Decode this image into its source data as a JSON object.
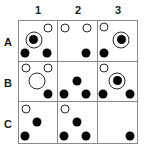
{
  "figure": {
    "colors": {
      "grid_line": "#8a8a8a",
      "token_fill": "#050505",
      "token_outline": "#2a2a2a",
      "label_text": "#1a1a1a",
      "background": "#ffffff"
    }
  },
  "column_headers": [
    {
      "label": "1"
    },
    {
      "label": "2"
    },
    {
      "label": "3"
    }
  ],
  "row_headers": [
    {
      "label": "A"
    },
    {
      "label": "B"
    },
    {
      "label": "C"
    }
  ],
  "grid": {
    "rows": 3,
    "columns": 3,
    "cells": [
      {
        "id": "A1",
        "row": "A",
        "column": "1",
        "tokens": [
          {
            "kind": "open-circle",
            "x": 76,
            "y": 18
          },
          {
            "kind": "ringed-circle",
            "x": 38,
            "y": 47
          },
          {
            "kind": "filled-circle",
            "x": 16,
            "y": 80
          },
          {
            "kind": "filled-circle",
            "x": 74,
            "y": 80
          }
        ]
      },
      {
        "id": "A2",
        "row": "A",
        "column": "2",
        "tokens": [
          {
            "kind": "open-circle",
            "x": 18,
            "y": 18
          },
          {
            "kind": "open-circle",
            "x": 74,
            "y": 18
          },
          {
            "kind": "filled-circle",
            "x": 72,
            "y": 80
          }
        ]
      },
      {
        "id": "A3",
        "row": "A",
        "column": "3",
        "tokens": [
          {
            "kind": "open-circle",
            "x": 16,
            "y": 16
          },
          {
            "kind": "ringed-circle",
            "x": 60,
            "y": 47
          },
          {
            "kind": "filled-circle",
            "x": 16,
            "y": 80
          }
        ]
      },
      {
        "id": "B1",
        "row": "B",
        "column": "1",
        "tokens": [
          {
            "kind": "open-circle",
            "x": 18,
            "y": 16
          },
          {
            "kind": "open-circle",
            "x": 76,
            "y": 16
          },
          {
            "kind": "open-circle-large",
            "x": 46,
            "y": 48
          },
          {
            "kind": "filled-circle",
            "x": 76,
            "y": 82
          }
        ]
      },
      {
        "id": "B2",
        "row": "B",
        "column": "2",
        "tokens": [
          {
            "kind": "filled-circle",
            "x": 48,
            "y": 48
          },
          {
            "kind": "filled-circle",
            "x": 16,
            "y": 82
          },
          {
            "kind": "filled-circle",
            "x": 72,
            "y": 82
          }
        ]
      },
      {
        "id": "B3",
        "row": "B",
        "column": "3",
        "tokens": [
          {
            "kind": "open-circle",
            "x": 16,
            "y": 16
          },
          {
            "kind": "ringed-circle",
            "x": 50,
            "y": 48
          },
          {
            "kind": "filled-circle",
            "x": 14,
            "y": 82
          },
          {
            "kind": "filled-circle",
            "x": 82,
            "y": 82
          }
        ]
      },
      {
        "id": "C1",
        "row": "C",
        "column": "1",
        "tokens": [
          {
            "kind": "open-circle",
            "x": 18,
            "y": 16
          },
          {
            "kind": "filled-circle",
            "x": 48,
            "y": 48
          },
          {
            "kind": "filled-circle",
            "x": 16,
            "y": 82
          }
        ]
      },
      {
        "id": "C2",
        "row": "C",
        "column": "2",
        "tokens": [
          {
            "kind": "open-circle",
            "x": 18,
            "y": 16
          },
          {
            "kind": "filled-circle",
            "x": 48,
            "y": 48
          },
          {
            "kind": "filled-circle",
            "x": 16,
            "y": 82
          },
          {
            "kind": "filled-circle",
            "x": 72,
            "y": 82
          }
        ]
      },
      {
        "id": "C3",
        "row": "C",
        "column": "3",
        "tokens": [
          {
            "kind": "filled-circle",
            "x": 82,
            "y": 82
          }
        ]
      }
    ]
  }
}
